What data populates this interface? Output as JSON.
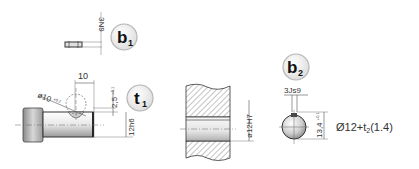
{
  "figure": {
    "type": "engineering-drawing",
    "views": {
      "key_b1": {
        "badge": {
          "letter": "b",
          "subscript": "1"
        },
        "tolerance_label": "3N9"
      },
      "shaft_t1": {
        "badge": {
          "letter": "t",
          "subscript": "1"
        },
        "dimensions": {
          "width": "10",
          "ball_diameter": "ø10",
          "ball_diameter_tolerance": "+0.2",
          "depth": "2,5",
          "depth_tolerance": "+0.1",
          "shaft_diameter": "12h6"
        }
      },
      "hub_section": {
        "bore_label": "ø12H7"
      },
      "ball_b2": {
        "badge": {
          "letter": "b",
          "subscript": "2"
        },
        "dimensions": {
          "slot_width": "3Js9",
          "height": "13,4",
          "height_tolerance": "+0.1",
          "diameter_formula_prefix": "Ø12+t",
          "diameter_formula_sub": "2",
          "diameter_formula_suffix": "(1.4)"
        }
      }
    },
    "colors": {
      "line": "#333333",
      "dimension_line": "#555555",
      "hatch": "#8a8a8a",
      "badge_fill": "#eeeeee",
      "badge_border": "#b5b5b5"
    }
  }
}
